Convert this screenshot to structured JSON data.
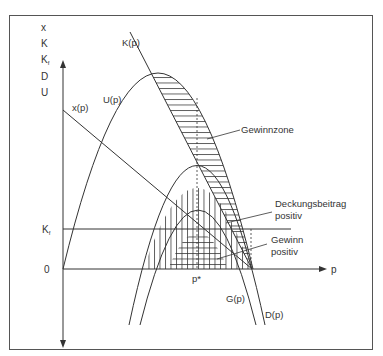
{
  "diagram": {
    "y_axis_labels": [
      "x",
      "K",
      "K",
      "D",
      "U"
    ],
    "y_axis_subscript_f": "f",
    "x_axis_label": "p",
    "ticks": {
      "kf_label": "K",
      "kf_sub": "f",
      "zero_label": "0",
      "p_star_label": "p*"
    },
    "curves": {
      "K": "K(p)",
      "U": "U(p)",
      "x": "x(p)",
      "G": "G(p)",
      "D": "D(p)"
    },
    "annotations": {
      "gewinnzone": "Gewinnzone",
      "deckung_line1": "Deckungsbeitrag",
      "deckung_line2": "positiv",
      "gewinn_line1": "Gewinn",
      "gewinn_line2": "positiv"
    },
    "colors": {
      "ink": "#333333",
      "frame": "#555555",
      "background": "#ffffff"
    }
  }
}
